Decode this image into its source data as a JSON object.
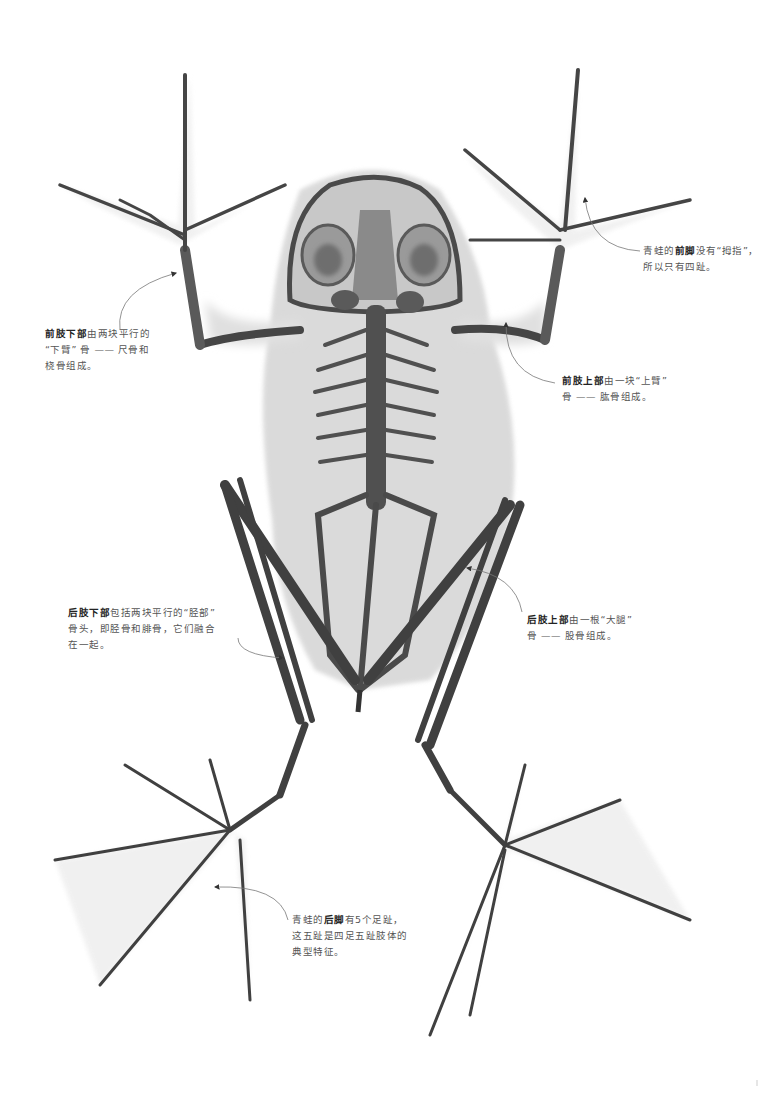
{
  "figure": {
    "colors": {
      "background": "#ffffff",
      "bone_dark": "#3f3f3f",
      "bone_mid": "#6d6d6d",
      "soft_tissue": "#d9d9d9",
      "text": "#555555",
      "text_bold": "#222222",
      "callout_line": "#777777"
    }
  },
  "annotations": [
    {
      "id": "forelimb-lower",
      "bold": "前肢下部",
      "line1_rest": "由两块平行的",
      "line2": "“下臂” 骨 —— 尺骨和",
      "line3": "桡骨组成。"
    },
    {
      "id": "forefoot",
      "prefix": "青蛙的",
      "bold": "前脚",
      "line1_rest": "没有“拇指”，",
      "line2": "所以只有四趾。"
    },
    {
      "id": "forelimb-upper",
      "bold": "前肢上部",
      "line1_rest": "由一块“上臂”",
      "line2": "骨 —— 肱骨组成。"
    },
    {
      "id": "hindlimb-lower",
      "bold": "后肢下部",
      "line1_rest": "包括两块平行的“胫部”",
      "line2": "骨头，即胫骨和腓骨，它们融合",
      "line3": "在一起。"
    },
    {
      "id": "hindlimb-upper",
      "bold": "后肢上部",
      "line1_rest": "由一根“大腿”",
      "line2": "骨 —— 股骨组成。"
    },
    {
      "id": "hindfoot",
      "prefix": "青蛙的",
      "bold": "后脚",
      "line1_rest": "有5个足趾，",
      "line2": "这五趾是四足五趾肢体的",
      "line3": "典型特征。"
    }
  ]
}
